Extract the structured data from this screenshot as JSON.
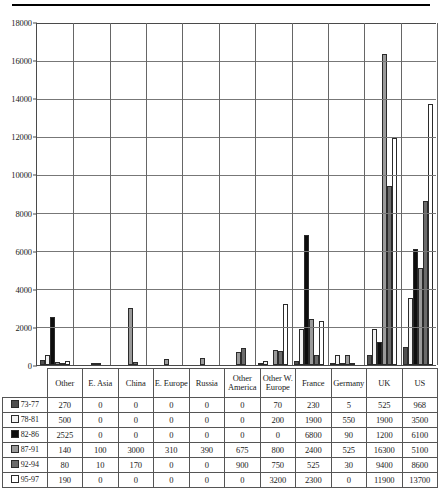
{
  "chart_data": {
    "type": "bar",
    "title": "",
    "subtitle": "",
    "xlabel": "",
    "ylabel": "",
    "ylim": [
      0,
      18000
    ],
    "ytick_labels": [
      "0",
      "2000",
      "4000",
      "6000",
      "8000",
      "10000",
      "12000",
      "14000",
      "16000",
      "18000"
    ],
    "ytick_values": [
      0,
      2000,
      4000,
      6000,
      8000,
      10000,
      12000,
      14000,
      16000,
      18000
    ],
    "grid": true,
    "legend_position": "table-row-labels",
    "categories": [
      "Other",
      "E. Asia",
      "China",
      "E. Europe",
      "Russia",
      "Other America",
      "Other W. Europe",
      "France",
      "Germany",
      "UK",
      "US"
    ],
    "series": [
      {
        "name": "73-77",
        "color": "#4f4f4f",
        "values": [
          270,
          0,
          0,
          0,
          0,
          0,
          70,
          230,
          5,
          525,
          968
        ]
      },
      {
        "name": "78-81",
        "color": "#f2f2f2",
        "values": [
          500,
          0,
          0,
          0,
          0,
          0,
          200,
          1900,
          550,
          1900,
          3500
        ]
      },
      {
        "name": "82-86",
        "color": "#0d0d0d",
        "values": [
          2525,
          0,
          0,
          0,
          0,
          0,
          0,
          6800,
          90,
          1200,
          6100
        ]
      },
      {
        "name": "87-91",
        "color": "#9a9a9a",
        "values": [
          140,
          100,
          3000,
          310,
          390,
          675,
          800,
          2400,
          525,
          16300,
          5100
        ]
      },
      {
        "name": "92-94",
        "color": "#6b6b6b",
        "values": [
          80,
          10,
          170,
          0,
          0,
          900,
          750,
          525,
          30,
          9400,
          8600
        ]
      },
      {
        "name": "95-97",
        "color": "#ffffff",
        "values": [
          190,
          0,
          0,
          0,
          0,
          0,
          3200,
          2300,
          0,
          11900,
          13700
        ]
      }
    ]
  },
  "table": {
    "column_headers": [
      "Other",
      "E. Asia",
      "China",
      "E. Europe",
      "Russia",
      "Other America",
      "Other W. Europe",
      "France",
      "Germany",
      "UK",
      "US"
    ],
    "row_labels": [
      "73-77",
      "78-81",
      "82-86",
      "87-91",
      "92-94",
      "95-97"
    ],
    "rows": [
      [
        "270",
        "0",
        "0",
        "0",
        "0",
        "0",
        "70",
        "230",
        "5",
        "525",
        "968"
      ],
      [
        "500",
        "0",
        "0",
        "0",
        "0",
        "0",
        "200",
        "1900",
        "550",
        "1900",
        "3500"
      ],
      [
        "2525",
        "0",
        "0",
        "0",
        "0",
        "0",
        "0",
        "6800",
        "90",
        "1200",
        "6100"
      ],
      [
        "140",
        "100",
        "3000",
        "310",
        "390",
        "675",
        "800",
        "2400",
        "525",
        "16300",
        "5100"
      ],
      [
        "80",
        "10",
        "170",
        "0",
        "0",
        "900",
        "750",
        "525",
        "30",
        "9400",
        "8600"
      ],
      [
        "190",
        "0",
        "0",
        "0",
        "0",
        "0",
        "3200",
        "2300",
        "0",
        "11900",
        "13700"
      ]
    ]
  }
}
